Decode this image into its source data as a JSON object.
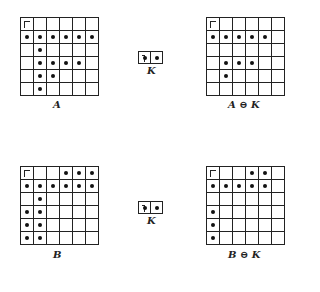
{
  "panels": [
    {
      "id": "A",
      "label": "A",
      "x": 20,
      "y": 17,
      "rows": 6,
      "cols": 6,
      "origin": [
        0,
        0
      ],
      "dots": [
        [
          1,
          0
        ],
        [
          1,
          1
        ],
        [
          1,
          2
        ],
        [
          1,
          3
        ],
        [
          1,
          4
        ],
        [
          1,
          5
        ],
        [
          2,
          1
        ],
        [
          3,
          1
        ],
        [
          3,
          2
        ],
        [
          3,
          3
        ],
        [
          3,
          4
        ],
        [
          4,
          1
        ],
        [
          4,
          2
        ],
        [
          5,
          1
        ]
      ],
      "label_x": 59,
      "label_y": 100
    },
    {
      "id": "A_erode_K",
      "label": "A ⊖ K",
      "x": 206,
      "y": 17,
      "rows": 6,
      "cols": 6,
      "origin": [
        0,
        0
      ],
      "dots": [
        [
          1,
          0
        ],
        [
          1,
          1
        ],
        [
          1,
          2
        ],
        [
          1,
          3
        ],
        [
          1,
          4
        ],
        [
          3,
          1
        ],
        [
          3,
          2
        ],
        [
          3,
          3
        ],
        [
          4,
          1
        ]
      ],
      "label_x": 245,
      "label_y": 100
    },
    {
      "id": "B",
      "label": "B",
      "x": 20,
      "y": 166,
      "rows": 6,
      "cols": 6,
      "origin": [
        0,
        0
      ],
      "dots": [
        [
          0,
          3
        ],
        [
          0,
          4
        ],
        [
          0,
          5
        ],
        [
          1,
          0
        ],
        [
          1,
          1
        ],
        [
          1,
          2
        ],
        [
          1,
          3
        ],
        [
          1,
          4
        ],
        [
          1,
          5
        ],
        [
          2,
          1
        ],
        [
          3,
          0
        ],
        [
          3,
          1
        ],
        [
          4,
          0
        ],
        [
          4,
          1
        ],
        [
          5,
          0
        ],
        [
          5,
          1
        ]
      ],
      "label_x": 59,
      "label_y": 250
    },
    {
      "id": "B_erode_K",
      "label": "B ⊖ K",
      "x": 206,
      "y": 166,
      "rows": 6,
      "cols": 6,
      "origin": [
        0,
        0
      ],
      "dots": [
        [
          0,
          3
        ],
        [
          0,
          4
        ],
        [
          1,
          0
        ],
        [
          1,
          1
        ],
        [
          1,
          2
        ],
        [
          1,
          3
        ],
        [
          1,
          4
        ],
        [
          3,
          0
        ],
        [
          4,
          0
        ],
        [
          5,
          0
        ]
      ],
      "label_x": 245,
      "label_y": 250
    }
  ],
  "kernels": [
    {
      "id": "K_top",
      "label": "K",
      "x": 138,
      "y": 51,
      "cells": 2,
      "origin": 0,
      "dots": [
        0,
        1
      ],
      "label_x": 151,
      "label_y": 66
    },
    {
      "id": "K_bottom",
      "label": "K",
      "x": 138,
      "y": 201,
      "cells": 2,
      "origin": 0,
      "dots": [
        0,
        1
      ],
      "label_x": 151,
      "label_y": 216
    }
  ]
}
